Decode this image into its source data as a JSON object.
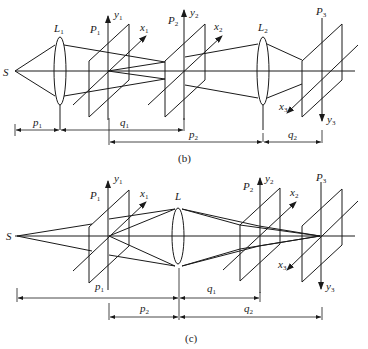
{
  "diagram_b": {
    "caption": "(b)",
    "source": "S",
    "lens1": {
      "name": "L",
      "sub": "1"
    },
    "lens2": {
      "name": "L",
      "sub": "2"
    },
    "plane1": {
      "name": "P",
      "sub": "1"
    },
    "plane2": {
      "name": "P",
      "sub": "2"
    },
    "plane3": {
      "name": "P",
      "sub": "3"
    },
    "axes": {
      "y1": {
        "name": "y",
        "sub": "1"
      },
      "x1": {
        "name": "x",
        "sub": "1"
      },
      "y2": {
        "name": "y",
        "sub": "2"
      },
      "x2": {
        "name": "x",
        "sub": "2"
      },
      "x3": {
        "name": "x",
        "sub": "3"
      },
      "y3": {
        "name": "y",
        "sub": "3"
      }
    },
    "dims": {
      "p1": {
        "name": "p",
        "sub": "1"
      },
      "q1": {
        "name": "q",
        "sub": "1"
      },
      "p2": {
        "name": "p",
        "sub": "2"
      },
      "q2": {
        "name": "q",
        "sub": "2"
      }
    }
  },
  "diagram_c": {
    "caption": "(c)",
    "source": "S",
    "lens": {
      "name": "L",
      "sub": ""
    },
    "plane1": {
      "name": "P",
      "sub": "1"
    },
    "plane1_bottom": {
      "name": "p",
      "sub": "1"
    },
    "plane2": {
      "name": "P",
      "sub": "2"
    },
    "plane3": {
      "name": "P",
      "sub": "3"
    },
    "axes": {
      "y1": {
        "name": "y",
        "sub": "1"
      },
      "x1": {
        "name": "x",
        "sub": "1"
      },
      "y2": {
        "name": "y",
        "sub": "2"
      },
      "x2": {
        "name": "x",
        "sub": "2"
      },
      "x3": {
        "name": "x",
        "sub": "3"
      },
      "y3": {
        "name": "y",
        "sub": "3"
      }
    },
    "dims": {
      "q1": {
        "name": "q",
        "sub": "1"
      },
      "p2": {
        "name": "p",
        "sub": "2"
      },
      "q2": {
        "name": "q",
        "sub": "2"
      }
    }
  }
}
